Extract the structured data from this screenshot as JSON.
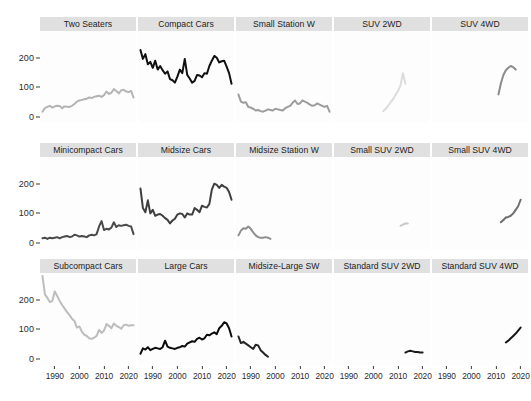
{
  "chart_data": {
    "type": "line",
    "title": "",
    "subtitle": "",
    "xlabel": "",
    "ylabel": "",
    "facet_layout": {
      "rows": 3,
      "cols": 5
    },
    "grid": false,
    "legend": "none",
    "xlim": [
      1984,
      2023
    ],
    "ylim": [
      -20,
      290
    ],
    "x_ticks": [
      1990,
      2000,
      2010,
      2020
    ],
    "x_tick_labels": [
      "1990",
      "2000",
      "2010",
      "2020"
    ],
    "y_ticks": [
      0,
      100,
      200
    ],
    "y_tick_labels": [
      "0",
      "100",
      "200"
    ],
    "strip_background": "#e0e0e0",
    "panel_background": "#fdfdfd",
    "panels": [
      {
        "label": "Two Seaters",
        "row": 0,
        "col": 0,
        "color": "#b4b4b4",
        "x": [
          1985,
          1986,
          1987,
          1988,
          1989,
          1990,
          1991,
          1992,
          1993,
          1994,
          1995,
          1996,
          1997,
          1998,
          1999,
          2000,
          2001,
          2002,
          2003,
          2004,
          2005,
          2006,
          2007,
          2008,
          2009,
          2010,
          2011,
          2012,
          2013,
          2014,
          2015,
          2016,
          2017,
          2018,
          2019,
          2020,
          2021,
          2022
        ],
        "y": [
          18,
          30,
          34,
          38,
          32,
          36,
          38,
          37,
          30,
          36,
          35,
          34,
          38,
          44,
          52,
          56,
          58,
          60,
          62,
          66,
          64,
          68,
          70,
          72,
          68,
          74,
          86,
          78,
          82,
          94,
          88,
          80,
          90,
          92,
          86,
          84,
          88,
          66
        ]
      },
      {
        "label": "Compact Cars",
        "row": 0,
        "col": 1,
        "color": "#111111",
        "x": [
          1985,
          1986,
          1987,
          1988,
          1989,
          1990,
          1991,
          1992,
          1993,
          1994,
          1995,
          1996,
          1997,
          1998,
          1999,
          2000,
          2001,
          2002,
          2003,
          2004,
          2005,
          2006,
          2007,
          2008,
          2009,
          2010,
          2011,
          2012,
          2013,
          2014,
          2015,
          2016,
          2017,
          2018,
          2019,
          2020,
          2021,
          2022
        ],
        "y": [
          226,
          196,
          212,
          178,
          186,
          166,
          190,
          160,
          172,
          158,
          146,
          154,
          128,
          124,
          116,
          136,
          160,
          148,
          196,
          142,
          130,
          116,
          122,
          142,
          140,
          134,
          148,
          146,
          172,
          190,
          206,
          200,
          184,
          188,
          190,
          170,
          148,
          112
        ]
      },
      {
        "label": "Small Station W",
        "row": 0,
        "col": 2,
        "color": "#9d9d9d",
        "x": [
          1985,
          1986,
          1987,
          1988,
          1989,
          1990,
          1991,
          1992,
          1993,
          1994,
          1995,
          1996,
          1997,
          1998,
          1999,
          2000,
          2001,
          2002,
          2003,
          2004,
          2005,
          2006,
          2007,
          2008,
          2009,
          2010,
          2011,
          2012,
          2013,
          2014,
          2015,
          2016,
          2017,
          2018,
          2019,
          2020,
          2021,
          2022
        ],
        "y": [
          76,
          52,
          48,
          50,
          34,
          32,
          28,
          22,
          24,
          20,
          18,
          22,
          26,
          24,
          22,
          28,
          26,
          24,
          22,
          30,
          34,
          38,
          48,
          56,
          44,
          46,
          56,
          52,
          48,
          42,
          38,
          40,
          46,
          42,
          38,
          34,
          38,
          18
        ]
      },
      {
        "label": "SUV 2WD",
        "row": 0,
        "col": 3,
        "color": "#dcdcdc",
        "x": [
          2004,
          2005,
          2006,
          2007,
          2008,
          2009,
          2010,
          2011,
          2012,
          2013
        ],
        "y": [
          20,
          28,
          38,
          50,
          60,
          74,
          88,
          106,
          148,
          112
        ]
      },
      {
        "label": "SUV 4WD",
        "row": 0,
        "col": 4,
        "color": "#8c8c8c",
        "x": [
          2011,
          2012,
          2013,
          2014,
          2015,
          2016,
          2017,
          2018
        ],
        "y": [
          76,
          114,
          142,
          158,
          166,
          172,
          168,
          160
        ]
      },
      {
        "label": "Minicompact Cars",
        "row": 1,
        "col": 0,
        "color": "#4a4a4a",
        "x": [
          1985,
          1986,
          1987,
          1988,
          1989,
          1990,
          1991,
          1992,
          1993,
          1994,
          1995,
          1996,
          1997,
          1998,
          1999,
          2000,
          2001,
          2002,
          2003,
          2004,
          2005,
          2006,
          2007,
          2008,
          2009,
          2010,
          2011,
          2012,
          2013,
          2014,
          2015,
          2016,
          2017,
          2018,
          2019,
          2020,
          2021,
          2022
        ],
        "y": [
          16,
          18,
          14,
          18,
          16,
          18,
          20,
          16,
          20,
          22,
          24,
          20,
          22,
          28,
          26,
          22,
          24,
          22,
          20,
          26,
          28,
          26,
          30,
          56,
          74,
          44,
          48,
          46,
          52,
          70,
          54,
          60,
          58,
          60,
          62,
          58,
          56,
          30
        ]
      },
      {
        "label": "Midsize Cars",
        "row": 1,
        "col": 1,
        "color": "#3f3f3f",
        "x": [
          1985,
          1986,
          1987,
          1988,
          1989,
          1990,
          1991,
          1992,
          1993,
          1994,
          1995,
          1996,
          1997,
          1998,
          1999,
          2000,
          2001,
          2002,
          2003,
          2004,
          2005,
          2006,
          2007,
          2008,
          2009,
          2010,
          2011,
          2012,
          2013,
          2014,
          2015,
          2016,
          2017,
          2018,
          2019,
          2020,
          2021,
          2022
        ],
        "y": [
          184,
          118,
          104,
          144,
          100,
          112,
          92,
          96,
          98,
          92,
          84,
          78,
          66,
          76,
          82,
          96,
          100,
          98,
          86,
          100,
          96,
          96,
          118,
          112,
          104,
          126,
          122,
          120,
          132,
          180,
          200,
          196,
          186,
          196,
          190,
          186,
          172,
          146
        ]
      },
      {
        "label": "Midsize Station W",
        "row": 1,
        "col": 2,
        "color": "#8f8f8f",
        "x": [
          1985,
          1986,
          1987,
          1988,
          1989,
          1990,
          1991,
          1992,
          1993,
          1994,
          1995,
          1996,
          1997,
          1998
        ],
        "y": [
          26,
          42,
          50,
          48,
          56,
          48,
          36,
          26,
          20,
          18,
          18,
          20,
          18,
          14
        ]
      },
      {
        "label": "Small SUV 2WD",
        "row": 1,
        "col": 3,
        "color": "#c9c9c9",
        "x": [
          2011,
          2012,
          2013,
          2014
        ],
        "y": [
          58,
          62,
          66,
          66
        ]
      },
      {
        "label": "Small SUV 4WD",
        "row": 1,
        "col": 4,
        "color": "#6e6e6e",
        "x": [
          2012,
          2013,
          2014,
          2015,
          2016,
          2017,
          2018,
          2019,
          2020
        ],
        "y": [
          70,
          78,
          86,
          88,
          92,
          100,
          112,
          124,
          146
        ]
      },
      {
        "label": "Subcompact Cars",
        "row": 2,
        "col": 0,
        "color": "#bdbdbd",
        "x": [
          1985,
          1986,
          1987,
          1988,
          1989,
          1990,
          1991,
          1992,
          1993,
          1994,
          1995,
          1996,
          1997,
          1998,
          1999,
          2000,
          2001,
          2002,
          2003,
          2004,
          2005,
          2006,
          2007,
          2008,
          2009,
          2010,
          2011,
          2012,
          2013,
          2014,
          2015,
          2016,
          2017,
          2018,
          2019,
          2020,
          2021,
          2022
        ],
        "y": [
          280,
          218,
          206,
          192,
          196,
          228,
          212,
          196,
          182,
          170,
          158,
          148,
          136,
          128,
          106,
          110,
          92,
          82,
          78,
          70,
          68,
          72,
          78,
          98,
          88,
          96,
          118,
          112,
          104,
          120,
          112,
          108,
          102,
          114,
          116,
          112,
          114,
          114
        ]
      },
      {
        "label": "Large Cars",
        "row": 2,
        "col": 1,
        "color": "#0c0c0c",
        "x": [
          1985,
          1986,
          1987,
          1988,
          1989,
          1990,
          1991,
          1992,
          1993,
          1994,
          1995,
          1996,
          1997,
          1998,
          1999,
          2000,
          2001,
          2002,
          2003,
          2004,
          2005,
          2006,
          2007,
          2008,
          2009,
          2010,
          2011,
          2012,
          2013,
          2014,
          2015,
          2016,
          2017,
          2018,
          2019,
          2020,
          2021,
          2022
        ],
        "y": [
          18,
          36,
          32,
          40,
          30,
          34,
          38,
          36,
          34,
          40,
          62,
          42,
          38,
          36,
          34,
          38,
          40,
          44,
          42,
          52,
          56,
          60,
          58,
          68,
          72,
          66,
          70,
          82,
          80,
          86,
          90,
          84,
          104,
          112,
          124,
          120,
          104,
          76
        ]
      },
      {
        "label": "Midsize-Large SW",
        "row": 2,
        "col": 2,
        "color": "#242424",
        "x": [
          1985,
          1986,
          1987,
          1988,
          1989,
          1990,
          1991,
          1992,
          1993,
          1994,
          1995,
          1996,
          1997
        ],
        "y": [
          76,
          54,
          58,
          52,
          46,
          40,
          34,
          48,
          46,
          30,
          22,
          14,
          8
        ]
      },
      {
        "label": "Standard SUV 2WD",
        "row": 2,
        "col": 3,
        "color": "#1a1a1a",
        "x": [
          2013,
          2014,
          2015,
          2016,
          2017,
          2018,
          2019,
          2020
        ],
        "y": [
          22,
          26,
          28,
          26,
          24,
          24,
          22,
          22
        ]
      },
      {
        "label": "Standard SUV 4WD",
        "row": 2,
        "col": 4,
        "color": "#151515",
        "x": [
          2014,
          2015,
          2016,
          2017,
          2018,
          2019,
          2020
        ],
        "y": [
          56,
          62,
          70,
          78,
          86,
          96,
          106
        ]
      }
    ]
  }
}
